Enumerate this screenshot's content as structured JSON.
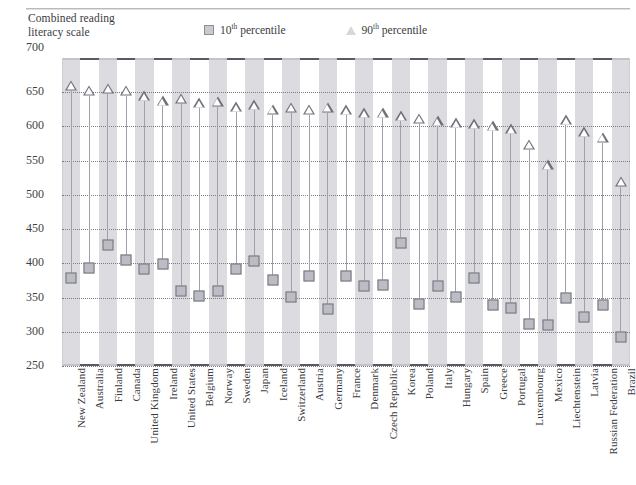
{
  "y_axis_title": "Combined reading\nliteracy scale",
  "legend": [
    {
      "name": "legend-10th",
      "marker": "square",
      "label_main": "10",
      "label_sup": "th",
      "label_rest": " percentile"
    },
    {
      "name": "legend-90th",
      "marker": "triangle",
      "label_main": "90",
      "label_sup": "th",
      "label_rest": " percentile"
    }
  ],
  "colors": {
    "square_fill": "#bcbcc4",
    "square_edge": "#73737c",
    "triangle_edge": "#70707a",
    "band": "#d5d5da",
    "stem": "#a0a0a8",
    "axis": "#5a5a62",
    "grid": "#7b7b84",
    "text": "#3b3b42"
  },
  "chart_data": {
    "type": "scatter",
    "title": "",
    "subtitle": "",
    "xlabel": "",
    "ylabel": "Combined reading literacy scale",
    "ylim": [
      250,
      700
    ],
    "yticks": [
      700,
      650,
      600,
      550,
      500,
      450,
      400,
      350,
      300,
      250
    ],
    "grid": true,
    "legend_position": "top",
    "categories": [
      "New Zealand",
      "Australia",
      "Finland",
      "Canada",
      "United Kingdom",
      "Ireland",
      "United States",
      "Belgium",
      "Norway",
      "Sweden",
      "Japan",
      "Iceland",
      "Switzerland",
      "Austria",
      "Germany",
      "France",
      "Denmark",
      "Czech Republic",
      "Korea",
      "Poland",
      "Italy",
      "Hungary",
      "Spain",
      "Greece",
      "Portugal",
      "Luxembourg",
      "Mexico",
      "Liechtenstein",
      "Latvia",
      "Russian Federation",
      "Brazil"
    ],
    "series": [
      {
        "name": "10th percentile",
        "marker": "square",
        "values": [
          378,
          393,
          427,
          405,
          391,
          399,
          360,
          353,
          360,
          391,
          404,
          375,
          351,
          382,
          333,
          381,
          367,
          368,
          430,
          340,
          367,
          351,
          378,
          339,
          335,
          311,
          310,
          349,
          321,
          339,
          292
        ]
      },
      {
        "name": "90th percentile",
        "marker": "triangle",
        "values": [
          652,
          645,
          648,
          645,
          637,
          630,
          633,
          627,
          629,
          621,
          624,
          617,
          620,
          617,
          620,
          616,
          612,
          612,
          608,
          604,
          600,
          597,
          596,
          593,
          589,
          566,
          536,
          602,
          584,
          576,
          512
        ]
      }
    ]
  }
}
